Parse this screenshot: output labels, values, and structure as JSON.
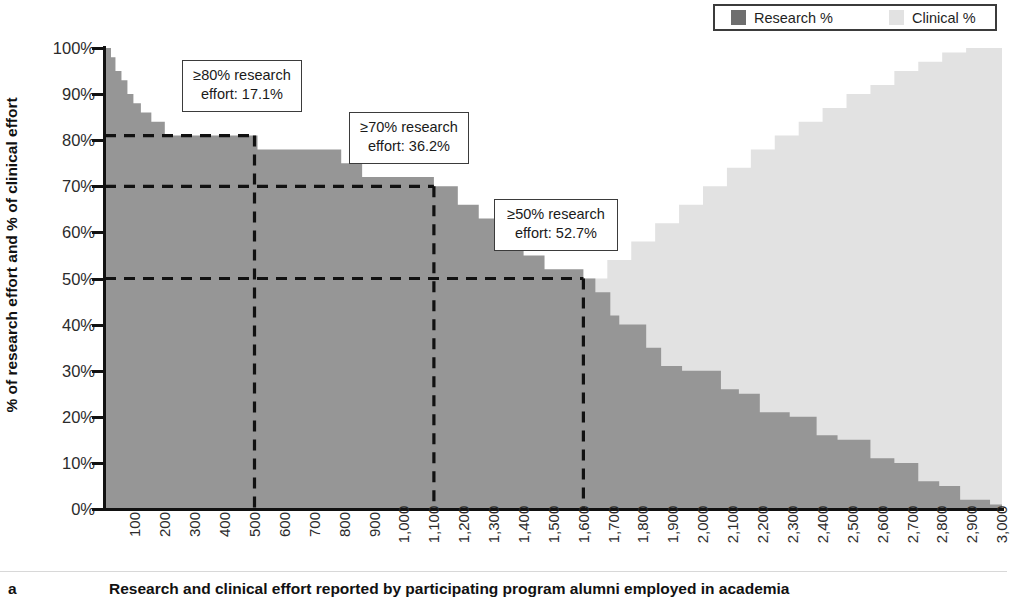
{
  "figure": {
    "panel_letter": "a",
    "caption": "Research and clinical effort reported by participating program alumni employed in academia"
  },
  "legend": {
    "position": "top-right",
    "entries": [
      {
        "label": "Research %",
        "color": "#6e6e6e",
        "name": "research-swatch"
      },
      {
        "label": "Clinical %",
        "color": "#e2e2e2",
        "name": "clinical-swatch"
      }
    ]
  },
  "annotations": [
    {
      "line1": "≥80% research",
      "line2": "effort: 17.1%",
      "threshold": 80,
      "value": "17.1%",
      "left": 182,
      "top": 60,
      "width": 120,
      "height": 52
    },
    {
      "line1": "≥70% research",
      "line2": "effort: 36.2%",
      "threshold": 70,
      "value": "36.2%",
      "left": 349,
      "top": 112,
      "width": 120,
      "height": 52
    },
    {
      "line1": "≥50% research",
      "line2": "effort: 52.7%",
      "threshold": 50,
      "value": "52.7%",
      "left": 494,
      "top": 199,
      "width": 124,
      "height": 52
    }
  ],
  "chart_data": {
    "type": "area",
    "title": "",
    "subtitle": "",
    "xlabel": "Research and clinical effort reported by participating program alumni employed in academia",
    "ylabel": "% of research effort and % of clinical effort",
    "grid": false,
    "legend_position": "top-right",
    "xlim": [
      0,
      3000
    ],
    "ylim": [
      0,
      100
    ],
    "yticks": [
      0,
      10,
      20,
      30,
      40,
      50,
      60,
      70,
      80,
      90,
      100
    ],
    "ytick_labels": [
      "0%",
      "10%",
      "20%",
      "30%",
      "40%",
      "50%",
      "60%",
      "70%",
      "80%",
      "90%",
      "100%"
    ],
    "xticks": [
      100,
      200,
      300,
      400,
      500,
      600,
      700,
      800,
      900,
      1000,
      1100,
      1200,
      1300,
      1400,
      1500,
      1600,
      1700,
      1800,
      1900,
      2000,
      2100,
      2200,
      2300,
      2400,
      2500,
      2600,
      2700,
      2800,
      2900,
      3000
    ],
    "xtick_labels": [
      "100",
      "200",
      "300",
      "400",
      "500",
      "600",
      "700",
      "800",
      "900",
      "1,000",
      "1,100",
      "1,200",
      "1,300",
      "1,400",
      "1,500",
      "1,600",
      "1,700",
      "1,800",
      "1,900",
      "2,000",
      "2,100",
      "2,200",
      "2,300",
      "2,400",
      "2,500",
      "2,600",
      "2,700",
      "2,800",
      "2,900",
      "3,000"
    ],
    "series": [
      {
        "name": "Research %",
        "color": "#969696",
        "note": "step-wise descending sorted distribution of research effort across alumni, x = alumnus rank (n ≈ 3000)",
        "steps": [
          [
            0,
            100
          ],
          [
            20,
            98
          ],
          [
            35,
            95
          ],
          [
            55,
            93
          ],
          [
            75,
            90
          ],
          [
            95,
            88
          ],
          [
            120,
            86
          ],
          [
            155,
            84
          ],
          [
            200,
            81
          ],
          [
            510,
            78
          ],
          [
            790,
            75
          ],
          [
            860,
            72
          ],
          [
            1100,
            70
          ],
          [
            1180,
            66
          ],
          [
            1250,
            63
          ],
          [
            1320,
            60
          ],
          [
            1400,
            55
          ],
          [
            1470,
            52
          ],
          [
            1600,
            50
          ],
          [
            1640,
            47
          ],
          [
            1690,
            42
          ],
          [
            1720,
            40
          ],
          [
            1810,
            35
          ],
          [
            1860,
            31
          ],
          [
            1930,
            30
          ],
          [
            2060,
            26
          ],
          [
            2120,
            25
          ],
          [
            2190,
            21
          ],
          [
            2290,
            20
          ],
          [
            2380,
            16
          ],
          [
            2450,
            15
          ],
          [
            2560,
            11
          ],
          [
            2640,
            10
          ],
          [
            2720,
            6
          ],
          [
            2790,
            5
          ],
          [
            2860,
            2
          ],
          [
            2960,
            1
          ],
          [
            3000,
            0
          ]
        ]
      },
      {
        "name": "Clinical %",
        "color": "#e2e2e2",
        "note": "step-wise ascending complement of clinical effort across the same alumni ranking",
        "steps": [
          [
            0,
            0
          ],
          [
            170,
            1
          ],
          [
            290,
            3
          ],
          [
            380,
            5
          ],
          [
            470,
            7
          ],
          [
            560,
            10
          ],
          [
            640,
            12
          ],
          [
            720,
            15
          ],
          [
            800,
            18
          ],
          [
            880,
            20
          ],
          [
            960,
            24
          ],
          [
            1040,
            26
          ],
          [
            1120,
            30
          ],
          [
            1200,
            33
          ],
          [
            1280,
            37
          ],
          [
            1360,
            40
          ],
          [
            1440,
            44
          ],
          [
            1520,
            47
          ],
          [
            1600,
            50
          ],
          [
            1680,
            54
          ],
          [
            1760,
            58
          ],
          [
            1840,
            62
          ],
          [
            1920,
            66
          ],
          [
            2000,
            70
          ],
          [
            2080,
            74
          ],
          [
            2160,
            78
          ],
          [
            2240,
            81
          ],
          [
            2320,
            84
          ],
          [
            2400,
            87
          ],
          [
            2480,
            90
          ],
          [
            2560,
            92
          ],
          [
            2640,
            95
          ],
          [
            2720,
            97
          ],
          [
            2800,
            99
          ],
          [
            2880,
            100
          ],
          [
            3000,
            100
          ]
        ]
      }
    ],
    "threshold_lines": [
      {
        "label": "≥80%",
        "y": 81,
        "x_end": 500,
        "style": "dashed"
      },
      {
        "label": "≥70%",
        "y": 70,
        "x_end": 1100,
        "style": "dashed"
      },
      {
        "label": "≥50%",
        "y": 50,
        "x_end": 1600,
        "style": "dashed"
      }
    ]
  }
}
